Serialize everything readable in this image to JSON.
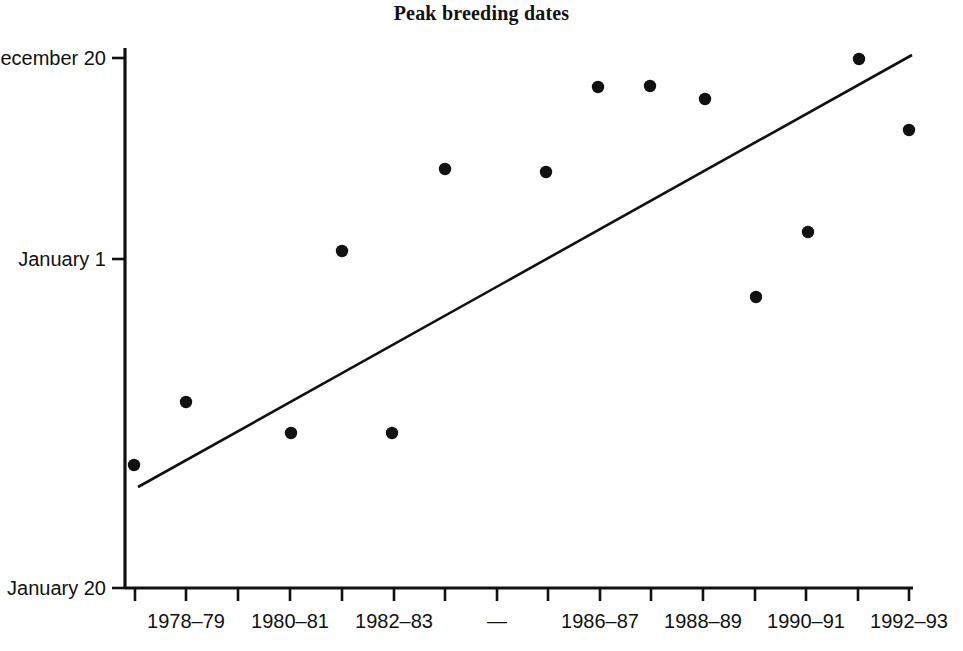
{
  "chart_data": {
    "type": "scatter",
    "title": "Peak breeding dates",
    "xlabel": "",
    "ylabel": "",
    "grid": false,
    "legend": "none",
    "axis_note": "Y axis is a date axis running December 20 (top) to January 20 (bottom); later dates are lower.",
    "y_tick_labels": [
      "December 20",
      "January 1",
      "January 20"
    ],
    "y_tick_values": [
      -12,
      0,
      19
    ],
    "ylim": [
      -12,
      19
    ],
    "x_tick_labels": [
      "",
      "1978–79",
      "",
      "1980–81",
      "",
      "1982–83",
      "",
      "—",
      "",
      "1986–87",
      "",
      "1988–89",
      "",
      "1990–91",
      "",
      "1992–93"
    ],
    "x_categories": [
      "1977–78",
      "1978–79",
      "1979–80",
      "1980–81",
      "1981–82",
      "1982–83",
      "1983–84",
      "1984–85",
      "1985–86",
      "1986–87",
      "1987–88",
      "1988–89",
      "1989–90",
      "1990–91",
      "1991–92",
      "1992–93"
    ],
    "points": [
      {
        "x": "1977–78",
        "y": "January 4"
      },
      {
        "x": "1978–79",
        "y": "January 1"
      },
      {
        "x": "1979–80",
        "y": "January 3"
      },
      {
        "x": "1980–81",
        "y": "December 31"
      },
      {
        "x": "1981–82",
        "y": "January 3"
      },
      {
        "x": "1982–83",
        "y": "December 26"
      },
      {
        "x": "1983–84",
        "y": "December 26"
      },
      {
        "x": "1985–86",
        "y": "December 22"
      },
      {
        "x": "1986–87",
        "y": "December 22"
      },
      {
        "x": "1987–88",
        "y": "December 23"
      },
      {
        "x": "1988–89",
        "y": "January 2"
      },
      {
        "x": "1989–90",
        "y": "December 30"
      },
      {
        "x": "1991–92",
        "y": "December 20"
      },
      {
        "x": "1992–93",
        "y": "December 24"
      }
    ],
    "trend": {
      "type": "linear-fit",
      "start": {
        "x": "1977–78",
        "y": "January 6"
      },
      "end": {
        "x": "1992–93",
        "y": "December 20"
      }
    },
    "colors": {
      "marker": "#111111",
      "line": "#111111",
      "axis": "#111111",
      "background": "#ffffff"
    }
  },
  "geometry": {
    "points_px": [
      [
        134,
        465
      ],
      [
        186,
        402
      ],
      [
        291,
        433
      ],
      [
        342,
        251
      ],
      [
        392,
        433
      ],
      [
        445,
        169
      ],
      [
        546,
        172
      ],
      [
        598,
        87
      ],
      [
        650,
        86
      ],
      [
        705,
        99
      ],
      [
        756,
        297
      ],
      [
        808,
        232
      ],
      [
        859,
        59
      ],
      [
        909,
        130
      ]
    ],
    "trend_px": {
      "x1": 138,
      "y1": 487,
      "x2": 912,
      "y2": 55
    },
    "y_axis_px": {
      "x": 125,
      "y_top": 48,
      "y_bottom": 588
    },
    "x_axis_px": {
      "y": 588,
      "x_left": 125,
      "x_right": 913
    },
    "y_ticks_px": [
      58,
      259,
      588
    ],
    "x_ticks_px": [
      135,
      186,
      238,
      290,
      342,
      394,
      445,
      497,
      548,
      600,
      651,
      703,
      755,
      806,
      858,
      909
    ],
    "marker_radius_px": 6.2
  }
}
